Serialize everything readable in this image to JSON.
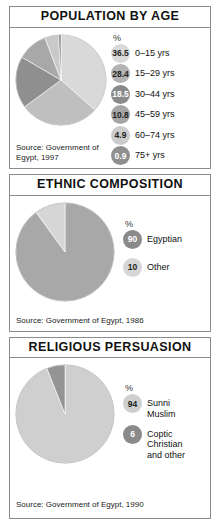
{
  "panels": [
    {
      "id": "population",
      "title": "POPULATION BY AGE",
      "pct_header": "%",
      "source": "Source: Government of\nEgypt, 1997"
    },
    {
      "id": "ethnic",
      "title": "ETHNIC COMPOSITION",
      "pct_header": "%",
      "source": "Source: Government of Egypt, 1986"
    },
    {
      "id": "religious",
      "title": "RELIGIOUS PERSUASION",
      "pct_header": "%",
      "source": "Source: Government of Egypt, 1990"
    }
  ],
  "chart_data": [
    {
      "type": "pie",
      "title": "POPULATION BY AGE",
      "unit": "%",
      "source": "Source: Government of Egypt, 1997",
      "categories": [
        "0–15 yrs",
        "15–29 yrs",
        "30–44 yrs",
        "45–59 yrs",
        "60–74 yrs",
        "75+ yrs"
      ],
      "values": [
        36.5,
        28.4,
        18.5,
        10.8,
        4.9,
        0.9
      ],
      "value_labels": [
        "36.5",
        "28.4",
        "18.5",
        "10.8",
        "4.9",
        "0.9"
      ],
      "colors": [
        "#d9d9d9",
        "#bfbfbf",
        "#8f8f8f",
        "#a8a8a8",
        "#c9c9c9",
        "#8a8a8a"
      ],
      "badge_colors": [
        "#d9d9d9",
        "#b3b3b3",
        "#8a8a8a",
        "#a6a6a6",
        "#cccccc",
        "#8f8f8f"
      ],
      "badge_text_colors": [
        "#222222",
        "#222222",
        "#ffffff",
        "#222222",
        "#222222",
        "#ffffff"
      ],
      "legend_position": "right",
      "start_angle_deg": 0
    },
    {
      "type": "pie",
      "title": "ETHNIC COMPOSITION",
      "unit": "%",
      "source": "Source: Government of Egypt, 1986",
      "categories": [
        "Egyptian",
        "Other"
      ],
      "values": [
        90,
        10
      ],
      "value_labels": [
        "90",
        "10"
      ],
      "colors": [
        "#a8a8a8",
        "#d6d6d6"
      ],
      "badge_colors": [
        "#8a8a8a",
        "#d6d6d6"
      ],
      "badge_text_colors": [
        "#ffffff",
        "#222222"
      ],
      "legend_position": "right",
      "start_angle_deg": 0
    },
    {
      "type": "pie",
      "title": "RELIGIOUS PERSUASION",
      "unit": "%",
      "source": "Source: Government of Egypt, 1990",
      "categories": [
        "Sunni\nMuslim",
        "Coptic\nChristian\nand other"
      ],
      "values": [
        94,
        6
      ],
      "value_labels": [
        "94",
        "6"
      ],
      "colors": [
        "#cfcfcf",
        "#949494"
      ],
      "badge_colors": [
        "#cfcfcf",
        "#8a8a8a"
      ],
      "badge_text_colors": [
        "#222222",
        "#ffffff"
      ],
      "legend_position": "right",
      "start_angle_deg": 0
    }
  ]
}
